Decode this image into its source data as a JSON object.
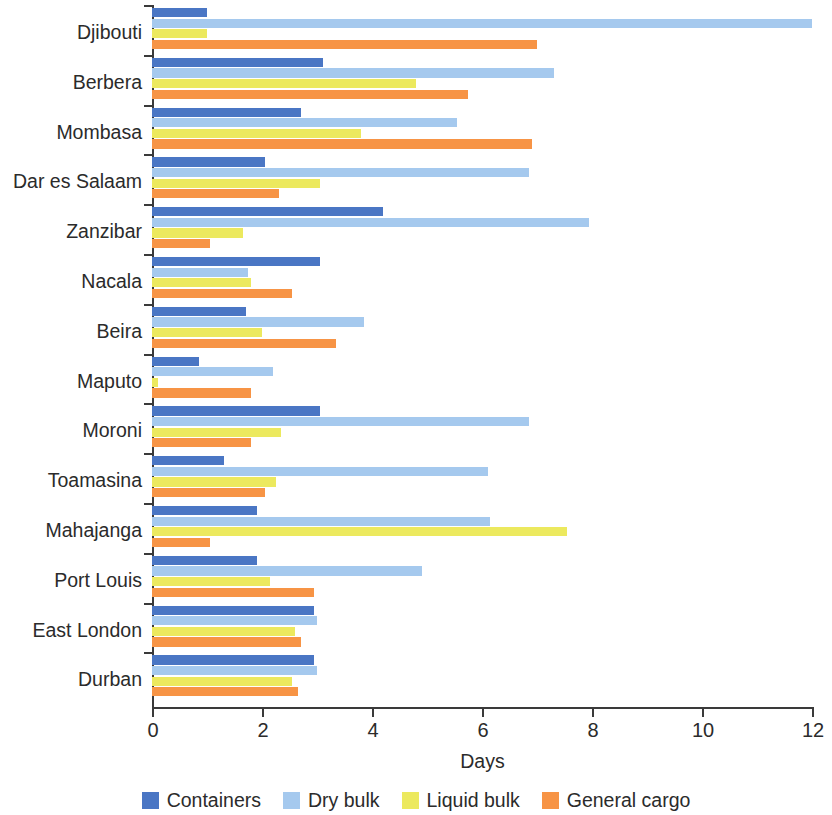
{
  "chart_data": {
    "type": "bar",
    "orientation": "horizontal",
    "title": "",
    "xlabel": "Days",
    "ylabel": "",
    "xlim": [
      0,
      12
    ],
    "xticks": [
      0,
      2,
      4,
      6,
      8,
      10,
      12
    ],
    "xtick_labels": [
      "0",
      "2",
      "4",
      "6",
      "8",
      "10",
      "12"
    ],
    "grid": false,
    "legend_position": "bottom",
    "categories": [
      "Djibouti",
      "Berbera",
      "Mombasa",
      "Dar es Salaam",
      "Zanzibar",
      "Nacala",
      "Beira",
      "Maputo",
      "Moroni",
      "Toamasina",
      "Mahajanga",
      "Port Louis",
      "East London",
      "Durban"
    ],
    "series": [
      {
        "name": "Containers",
        "color": "#4a76c4",
        "values": [
          1.0,
          3.1,
          2.7,
          2.05,
          4.2,
          3.05,
          1.7,
          0.85,
          3.05,
          1.3,
          1.9,
          1.9,
          2.95,
          2.95
        ]
      },
      {
        "name": "Dry bulk",
        "color": "#a5c9ee",
        "values": [
          12.0,
          7.3,
          5.55,
          6.85,
          7.95,
          1.75,
          3.85,
          2.2,
          6.85,
          6.1,
          6.15,
          4.9,
          3.0,
          3.0
        ]
      },
      {
        "name": "Liquid bulk",
        "color": "#ece95e",
        "values": [
          1.0,
          4.8,
          3.8,
          3.05,
          1.65,
          1.8,
          2.0,
          0.1,
          2.35,
          2.25,
          7.55,
          2.15,
          2.6,
          2.55
        ]
      },
      {
        "name": "General cargo",
        "color": "#f79445",
        "values": [
          7.0,
          5.75,
          6.9,
          2.3,
          1.05,
          2.55,
          3.35,
          1.8,
          1.8,
          2.05,
          1.05,
          2.95,
          2.7,
          2.65
        ]
      }
    ]
  },
  "legend": {
    "items": [
      {
        "label": "Containers",
        "color": "#4a76c4"
      },
      {
        "label": "Dry bulk",
        "color": "#a5c9ee"
      },
      {
        "label": "Liquid bulk",
        "color": "#ece95e"
      },
      {
        "label": "General cargo",
        "color": "#f79445"
      }
    ]
  }
}
